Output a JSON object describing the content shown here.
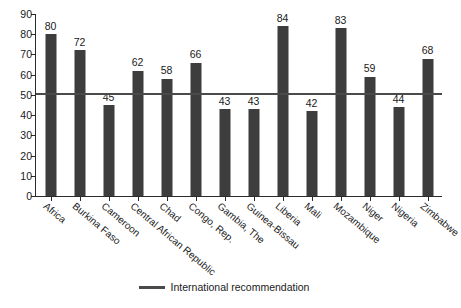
{
  "chart_data": {
    "type": "bar",
    "title": "",
    "xlabel": "",
    "ylabel": "",
    "ylim": [
      0,
      90
    ],
    "ytick_step": 10,
    "yticks": [
      0,
      10,
      20,
      30,
      40,
      50,
      60,
      70,
      80,
      90
    ],
    "grid": false,
    "legend_position": "bottom-center",
    "bar_color": "#3d3d3d",
    "reference_line_color": "#4a4a4a",
    "categories": [
      "Africa",
      "Burkina Faso",
      "Cameroon",
      "Central African Republic",
      "Chad",
      "Congo, Rep.",
      "Gambia, The",
      "Guinea-Bissau",
      "Liberia",
      "Mali",
      "Mozambique",
      "Niger",
      "Nigeria",
      "Zimbabwe"
    ],
    "values": [
      80,
      72,
      45,
      62,
      58,
      66,
      43,
      43,
      84,
      42,
      83,
      59,
      44,
      68
    ],
    "annotations": [
      {
        "type": "reference_line",
        "orientation": "horizontal",
        "value": 50,
        "label": "International recommendation"
      }
    ],
    "legend": [
      {
        "label": "International recommendation",
        "marker": "line",
        "color": "#4a4a4a"
      }
    ]
  }
}
